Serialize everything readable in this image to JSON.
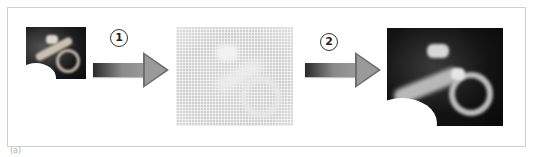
{
  "diagram": {
    "type": "image-processing-pipeline",
    "stages": [
      {
        "id": "input",
        "description": "small dark grayscale image of curved object"
      },
      {
        "id": "intermediate",
        "description": "faint halftone/dot-pattern light gray version"
      },
      {
        "id": "output",
        "description": "enlarged dark grayscale reconstructed image"
      }
    ],
    "steps": [
      {
        "number": "1",
        "from": "input",
        "to": "intermediate"
      },
      {
        "number": "2",
        "from": "intermediate",
        "to": "output"
      }
    ],
    "caption": "(a)"
  },
  "colors": {
    "frame_border": "#cfcfcf",
    "arrow_dark": "#2a2a2a",
    "arrow_light": "#9a9a9a",
    "background": "#ffffff"
  }
}
